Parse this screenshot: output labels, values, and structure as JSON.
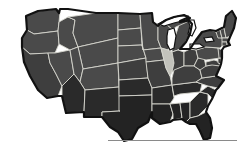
{
  "figure": {
    "projection": "albers-usa-like"
  },
  "colors": {
    "background": "#ffffff",
    "highlight_fill": "#c2c2bb",
    "state_fill_north": "#4a4a4a",
    "state_fill_mid": "#3e3e3e",
    "state_fill_south": "#2a2a2a",
    "state_fill_dark": "#232323",
    "state_border": "#d6d6ce",
    "nation_outline": "#111111",
    "lake_fill": "#ffffff",
    "rule": "#8a8a8a"
  },
  "legend": {
    "highlighted_state": "Illinois",
    "highlighted_abbr": "IL"
  },
  "regions": [
    {
      "abbr": "WA",
      "name": "Washington",
      "shade": "north"
    },
    {
      "abbr": "OR",
      "name": "Oregon",
      "shade": "north"
    },
    {
      "abbr": "CA",
      "name": "California",
      "shade": "mid"
    },
    {
      "abbr": "NV",
      "name": "Nevada",
      "shade": "north"
    },
    {
      "abbr": "ID",
      "name": "Idaho",
      "shade": "north"
    },
    {
      "abbr": "MT",
      "name": "Montana",
      "shade": "north"
    },
    {
      "abbr": "WY",
      "name": "Wyoming",
      "shade": "north"
    },
    {
      "abbr": "UT",
      "name": "Utah",
      "shade": "north"
    },
    {
      "abbr": "AZ",
      "name": "Arizona",
      "shade": "south"
    },
    {
      "abbr": "CO",
      "name": "Colorado",
      "shade": "north"
    },
    {
      "abbr": "NM",
      "name": "New Mexico",
      "shade": "south"
    },
    {
      "abbr": "ND",
      "name": "North Dakota",
      "shade": "north"
    },
    {
      "abbr": "SD",
      "name": "South Dakota",
      "shade": "north"
    },
    {
      "abbr": "NE",
      "name": "Nebraska",
      "shade": "north"
    },
    {
      "abbr": "KS",
      "name": "Kansas",
      "shade": "mid"
    },
    {
      "abbr": "OK",
      "name": "Oklahoma",
      "shade": "south"
    },
    {
      "abbr": "TX",
      "name": "Texas",
      "shade": "dark"
    },
    {
      "abbr": "MN",
      "name": "Minnesota",
      "shade": "north"
    },
    {
      "abbr": "IA",
      "name": "Iowa",
      "shade": "north"
    },
    {
      "abbr": "MO",
      "name": "Missouri",
      "shade": "mid"
    },
    {
      "abbr": "AR",
      "name": "Arkansas",
      "shade": "south"
    },
    {
      "abbr": "LA",
      "name": "Louisiana",
      "shade": "dark"
    },
    {
      "abbr": "WI",
      "name": "Wisconsin",
      "shade": "north"
    },
    {
      "abbr": "IL",
      "name": "Illinois",
      "shade": "highlight"
    },
    {
      "abbr": "MI",
      "name": "Michigan",
      "shade": "north"
    },
    {
      "abbr": "IN",
      "name": "Indiana",
      "shade": "mid"
    },
    {
      "abbr": "OH",
      "name": "Ohio",
      "shade": "mid"
    },
    {
      "abbr": "KY",
      "name": "Kentucky",
      "shade": "mid"
    },
    {
      "abbr": "TN",
      "name": "Tennessee",
      "shade": "south"
    },
    {
      "abbr": "MS",
      "name": "Mississippi",
      "shade": "dark"
    },
    {
      "abbr": "AL",
      "name": "Alabama",
      "shade": "dark"
    },
    {
      "abbr": "GA",
      "name": "Georgia",
      "shade": "south"
    },
    {
      "abbr": "FL",
      "name": "Florida",
      "shade": "dark"
    },
    {
      "abbr": "SC",
      "name": "South Carolina",
      "shade": "south"
    },
    {
      "abbr": "NC",
      "name": "North Carolina",
      "shade": "mid"
    },
    {
      "abbr": "VA",
      "name": "Virginia",
      "shade": "mid"
    },
    {
      "abbr": "WV",
      "name": "West Virginia",
      "shade": "mid"
    },
    {
      "abbr": "PA",
      "name": "Pennsylvania",
      "shade": "north"
    },
    {
      "abbr": "NY",
      "name": "New York",
      "shade": "north"
    },
    {
      "abbr": "ME",
      "name": "Maine",
      "shade": "north"
    },
    {
      "abbr": "VT",
      "name": "Vermont",
      "shade": "north"
    },
    {
      "abbr": "NH",
      "name": "New Hampshire",
      "shade": "north"
    },
    {
      "abbr": "MA",
      "name": "Massachusetts",
      "shade": "north"
    },
    {
      "abbr": "CT",
      "name": "Connecticut",
      "shade": "north"
    },
    {
      "abbr": "RI",
      "name": "Rhode Island",
      "shade": "north"
    },
    {
      "abbr": "NJ",
      "name": "New Jersey",
      "shade": "north"
    },
    {
      "abbr": "DE",
      "name": "Delaware",
      "shade": "mid"
    },
    {
      "abbr": "MD",
      "name": "Maryland",
      "shade": "mid"
    }
  ],
  "water": [
    {
      "name": "Lake Superior"
    },
    {
      "name": "Lake Michigan"
    },
    {
      "name": "Lake Huron"
    },
    {
      "name": "Lake Erie"
    },
    {
      "name": "Lake Ontario"
    }
  ]
}
